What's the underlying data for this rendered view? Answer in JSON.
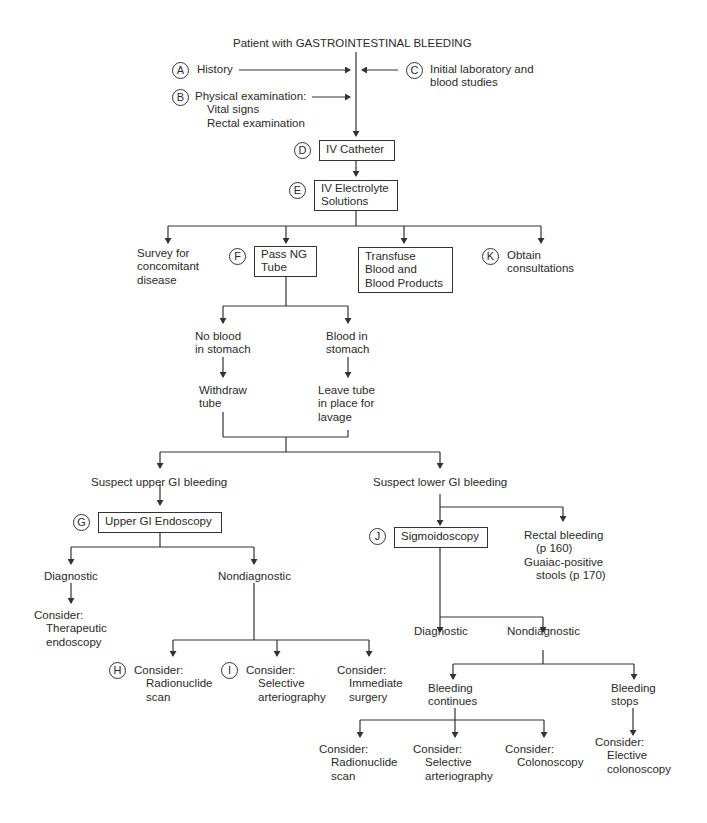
{
  "title": "Patient with GASTROINTESTINAL BLEEDING",
  "colors": {
    "line": "#333333",
    "text": "#2a2a2a",
    "background": "#ffffff"
  },
  "inputs": {
    "A": {
      "marker": "A",
      "label": "History"
    },
    "B": {
      "marker": "B",
      "label": "Physical examination:",
      "sub": [
        "Vital signs",
        "Rectal examination"
      ]
    },
    "C": {
      "marker": "C",
      "lines": [
        "Initial laboratory and",
        "blood studies"
      ]
    }
  },
  "steps": {
    "D": {
      "marker": "D",
      "label": "IV Catheter"
    },
    "E": {
      "marker": "E",
      "lines": [
        "IV Electrolyte",
        "Solutions"
      ]
    }
  },
  "branches": {
    "survey": {
      "lines": [
        "Survey for",
        "concomitant",
        "disease"
      ]
    },
    "F": {
      "marker": "F",
      "lines": [
        "Pass NG",
        "Tube"
      ]
    },
    "transfuse": {
      "lines": [
        "Transfuse",
        "Blood and",
        "Blood Products"
      ]
    },
    "K": {
      "marker": "K",
      "lines": [
        "Obtain",
        "consultations"
      ]
    }
  },
  "ng": {
    "no_blood": {
      "lines": [
        "No blood",
        "in stomach"
      ]
    },
    "blood": {
      "lines": [
        "Blood in",
        "stomach"
      ]
    },
    "withdraw": {
      "lines": [
        "Withdraw",
        "tube"
      ]
    },
    "leave": {
      "lines": [
        "Leave tube",
        "in place for",
        "lavage"
      ]
    }
  },
  "upper": {
    "label": "Suspect upper GI bleeding",
    "G": {
      "marker": "G",
      "label": "Upper GI Endoscopy"
    },
    "diagnostic": "Diagnostic",
    "nondiagnostic": "Nondiagnostic",
    "therapeutic": {
      "lines": [
        "Consider:",
        "Therapeutic",
        "endoscopy"
      ]
    },
    "H": {
      "marker": "H",
      "lines": [
        "Consider:",
        "Radionuclide",
        "scan"
      ]
    },
    "I": {
      "marker": "I",
      "lines": [
        "Consider:",
        "Selective",
        "arteriography"
      ]
    },
    "surgery": {
      "lines": [
        "Consider:",
        "Immediate",
        "surgery"
      ]
    }
  },
  "lower": {
    "label": "Suspect lower GI bleeding",
    "J": {
      "marker": "J",
      "label": "Sigmoidoscopy"
    },
    "rectal": {
      "lines": [
        "Rectal bleeding",
        "(p 160)",
        "Guaiac-positive",
        "stools (p 170)"
      ]
    },
    "diagnostic": "Diagnostic",
    "nondiagnostic": "Nondiagnostic",
    "continues": {
      "lines": [
        "Bleeding",
        "continues"
      ]
    },
    "stops": {
      "lines": [
        "Bleeding",
        "stops"
      ]
    },
    "radionuclide": {
      "lines": [
        "Consider:",
        "Radionuclide",
        "scan"
      ]
    },
    "arteriography": {
      "lines": [
        "Consider:",
        "Selective",
        "arteriography"
      ]
    },
    "colonoscopy": {
      "lines": [
        "Consider:",
        "Colonoscopy"
      ]
    },
    "elective": {
      "lines": [
        "Consider:",
        "Elective",
        "colonoscopy"
      ]
    }
  }
}
